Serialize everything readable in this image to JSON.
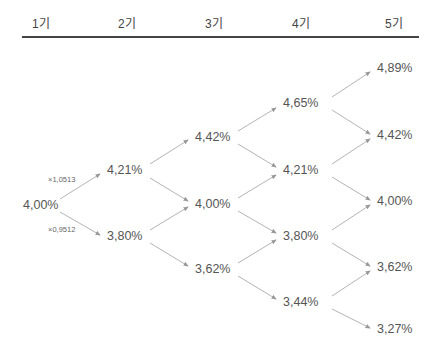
{
  "header": {
    "periods": [
      "1기",
      "2기",
      "3기",
      "4기",
      "5기"
    ]
  },
  "tree": {
    "multipliers": {
      "up": "×1,0513",
      "down": "×0,9512"
    },
    "nodes": {
      "p1": [
        "4,00%"
      ],
      "p2": [
        "4,21%",
        "3,80%"
      ],
      "p3": [
        "4,42%",
        "4,00%",
        "3,62%"
      ],
      "p4": [
        "4,65%",
        "4,21%",
        "3,80%",
        "3,44%"
      ],
      "p5": [
        "4,89%",
        "4,42%",
        "4,00%",
        "3,62%",
        "3,27%"
      ]
    },
    "colors": {
      "arrow": "#999999",
      "text": "#555555",
      "rule": "#444444"
    }
  }
}
